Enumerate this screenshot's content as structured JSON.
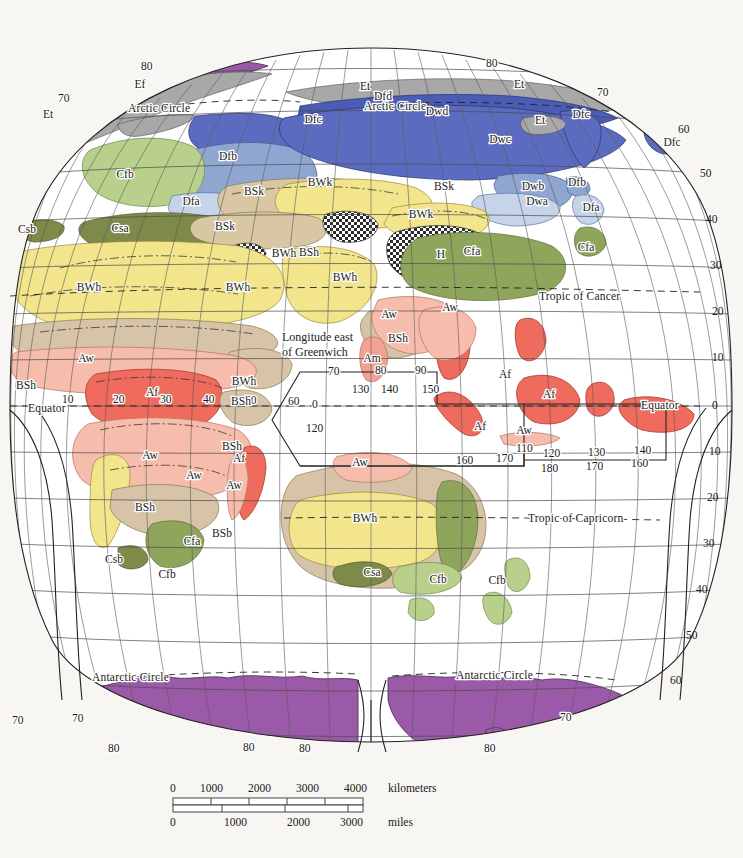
{
  "map": {
    "title": "Köppen Climate Classification — Eastern Hemisphere",
    "projection_note": "oval / interrupted global projection, eastern hemisphere sheet",
    "background_color": "#f7f6f2",
    "graticule_color": "#4a4a4a"
  },
  "reference_lines": [
    {
      "id": "arctic-circle-west",
      "label": "Arctic Circle"
    },
    {
      "id": "arctic-circle-east",
      "label": "Arctic Circle"
    },
    {
      "id": "tropic-of-cancer",
      "label": "Tropic of Cancer"
    },
    {
      "id": "tropic-of-capricorn",
      "label": "Tropic of Capricorn"
    },
    {
      "id": "equator-left",
      "label": "Equator"
    },
    {
      "id": "equator-right",
      "label": "Equator"
    },
    {
      "id": "antarctic-circle-west",
      "label": "Antarctic Circle"
    },
    {
      "id": "antarctic-circle-east",
      "label": "Antarctic Circle"
    }
  ],
  "annotations": {
    "longitude_note_line1": "Longitude east",
    "longitude_note_line2": "of Greenwich"
  },
  "latitude_labels_right": [
    "60",
    "50",
    "40",
    "30",
    "20",
    "10",
    "0",
    "10",
    "20",
    "30",
    "40",
    "50",
    "60",
    "70",
    "80"
  ],
  "latitude_labels_left": [
    "10",
    "70",
    "80"
  ],
  "longitude_labels_top": [
    "80",
    "70",
    "80",
    "70",
    "60"
  ],
  "longitude_labels_equator_row": [
    "10",
    "20",
    "30",
    "40",
    "50",
    "60",
    "70",
    "80",
    "90"
  ],
  "longitude_labels_inset_main": [
    "0",
    "120",
    "130",
    "140",
    "150",
    "160",
    "170",
    "180",
    "170",
    "160"
  ],
  "longitude_labels_inset_lower": [
    "110",
    "120",
    "130",
    "140"
  ],
  "antarctic_labels": [
    "70",
    "70",
    "80",
    "80",
    "80",
    "80",
    "70",
    "60"
  ],
  "climate_codes": {
    "Af": "Tropical rainforest",
    "Am": "Tropical monsoon",
    "Aw": "Tropical savanna",
    "BWh": "Hot desert",
    "BWk": "Cold desert",
    "BSh": "Hot steppe",
    "BSk": "Cold steppe",
    "BSb": "Steppe (marine influenced)",
    "Csa": "Mediterranean hot summer",
    "Csb": "Mediterranean warm summer",
    "Cfa": "Humid subtropical",
    "Cfb": "Marine west coast",
    "Dfa": "Humid continental hot summer",
    "Dfb": "Humid continental warm summer",
    "Dfc": "Subarctic",
    "Dfd": "Subarctic extremely cold",
    "Dwa": "Monsoon continental hot summer",
    "Dwb": "Monsoon continental warm summer",
    "Dwc": "Monsoon subarctic",
    "Dwd": "Monsoon subarctic extremely cold",
    "Et": "Tundra",
    "Ef": "Ice cap",
    "H": "Highland"
  },
  "zone_labels": [
    {
      "code": "Ef",
      "x": 140,
      "y": 88
    },
    {
      "code": "Et",
      "x": 48,
      "y": 118
    },
    {
      "code": "Et",
      "x": 365,
      "y": 90
    },
    {
      "code": "Et",
      "x": 519,
      "y": 88
    },
    {
      "code": "Et",
      "x": 540,
      "y": 124
    },
    {
      "code": "Dfd",
      "x": 383,
      "y": 100
    },
    {
      "code": "Dfc",
      "x": 313,
      "y": 123
    },
    {
      "code": "Dfc",
      "x": 581,
      "y": 118
    },
    {
      "code": "Dfc",
      "x": 672,
      "y": 146
    },
    {
      "code": "Dwd",
      "x": 437,
      "y": 115
    },
    {
      "code": "Dwc",
      "x": 500,
      "y": 143
    },
    {
      "code": "Dwb",
      "x": 533,
      "y": 190
    },
    {
      "code": "Dwa",
      "x": 537,
      "y": 205
    },
    {
      "code": "Dfb",
      "x": 228,
      "y": 160
    },
    {
      "code": "Dfb",
      "x": 577,
      "y": 186
    },
    {
      "code": "Dfa",
      "x": 191,
      "y": 205
    },
    {
      "code": "Dfa",
      "x": 591,
      "y": 211
    },
    {
      "code": "Cfb",
      "x": 125,
      "y": 178
    },
    {
      "code": "Cfa",
      "x": 472,
      "y": 255
    },
    {
      "code": "Cfa",
      "x": 586,
      "y": 251
    },
    {
      "code": "BSk",
      "x": 254,
      "y": 195
    },
    {
      "code": "BSk",
      "x": 444,
      "y": 190
    },
    {
      "code": "BWk",
      "x": 320,
      "y": 186
    },
    {
      "code": "BWk",
      "x": 421,
      "y": 218
    },
    {
      "code": "BSk",
      "x": 225,
      "y": 230
    },
    {
      "code": "Csa",
      "x": 120,
      "y": 232
    },
    {
      "code": "Csb",
      "x": 27,
      "y": 233
    },
    {
      "code": "BWh",
      "x": 89,
      "y": 291
    },
    {
      "code": "BWh",
      "x": 238,
      "y": 291
    },
    {
      "code": "BWh",
      "x": 284,
      "y": 257
    },
    {
      "code": "BWh",
      "x": 345,
      "y": 281
    },
    {
      "code": "BSh",
      "x": 309,
      "y": 256
    },
    {
      "code": "H",
      "x": 441,
      "y": 258
    },
    {
      "code": "Aw",
      "x": 389,
      "y": 318
    },
    {
      "code": "Aw",
      "x": 450,
      "y": 311
    },
    {
      "code": "BSh",
      "x": 398,
      "y": 342
    },
    {
      "code": "Am",
      "x": 372,
      "y": 362
    },
    {
      "code": "Af",
      "x": 505,
      "y": 378
    },
    {
      "code": "Af",
      "x": 549,
      "y": 398
    },
    {
      "code": "Af",
      "x": 480,
      "y": 430
    },
    {
      "code": "Aw",
      "x": 524,
      "y": 434
    },
    {
      "code": "Aw",
      "x": 86,
      "y": 362
    },
    {
      "code": "BSh",
      "x": 26,
      "y": 389
    },
    {
      "code": "Af",
      "x": 152,
      "y": 396
    },
    {
      "code": "BWh",
      "x": 244,
      "y": 385
    },
    {
      "code": "BSh",
      "x": 241,
      "y": 405
    },
    {
      "code": "BSh",
      "x": 232,
      "y": 450
    },
    {
      "code": "Aw",
      "x": 150,
      "y": 459
    },
    {
      "code": "Aw",
      "x": 194,
      "y": 479
    },
    {
      "code": "Af",
      "x": 239,
      "y": 462
    },
    {
      "code": "Aw",
      "x": 234,
      "y": 489
    },
    {
      "code": "BSh",
      "x": 145,
      "y": 511
    },
    {
      "code": "BSb",
      "x": 222,
      "y": 537
    },
    {
      "code": "Cfa",
      "x": 192,
      "y": 545
    },
    {
      "code": "Csb",
      "x": 114,
      "y": 563
    },
    {
      "code": "Cfb",
      "x": 167,
      "y": 578
    },
    {
      "code": "Aw",
      "x": 360,
      "y": 466
    },
    {
      "code": "BWh",
      "x": 365,
      "y": 522
    },
    {
      "code": "Csa",
      "x": 372,
      "y": 576
    },
    {
      "code": "Cfb",
      "x": 438,
      "y": 583
    },
    {
      "code": "Cfb",
      "x": 497,
      "y": 584
    }
  ],
  "scale": {
    "kilometers": {
      "unit_label": "kilometers",
      "ticks": [
        "0",
        "1000",
        "2000",
        "3000",
        "4000"
      ]
    },
    "miles": {
      "unit_label": "miles",
      "ticks": [
        "0",
        "1000",
        "2000",
        "3000"
      ]
    }
  },
  "colors": {
    "Af": "#ef6b5e",
    "Am": "#f2a293",
    "Aw": "#f7bdac",
    "BWh": "#f2e58c",
    "BWk": "#f2e58c",
    "BSh": "#d6c3a8",
    "BSk": "#d8c7a2",
    "BSb": "#d6c3a8",
    "Csa": "#7d8a4a",
    "Csb": "#7d8a4a",
    "Cfa": "#8ea55b",
    "Cfb": "#b9d08c",
    "Dfa": "#c5d4e8",
    "Dfb": "#8fa6d1",
    "Dfc": "#5b6cc0",
    "Dfd": "#4b5cb5",
    "Dwa": "#c5d4e8",
    "Dwb": "#8fa6d1",
    "Dwc": "#5b6cc0",
    "Dwd": "#4b5cb5",
    "Et": "#a8a8a8",
    "Ef": "#9b5aa8",
    "H": "#c9c9c9",
    "ocean": "#ffffff",
    "page": "#f7f6f2"
  }
}
